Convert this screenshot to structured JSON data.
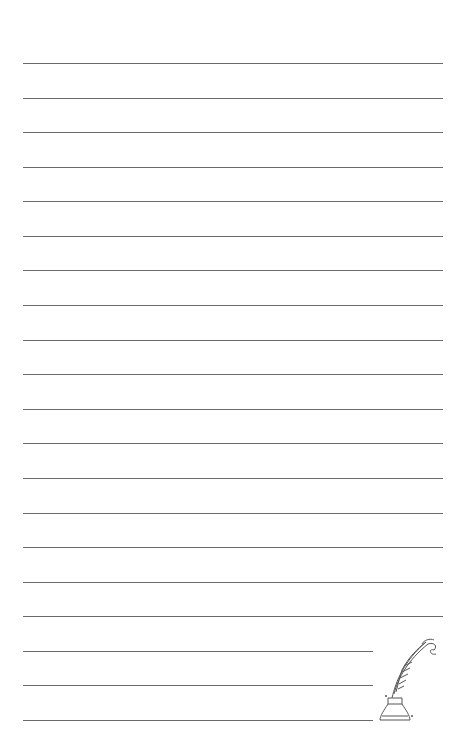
{
  "page": {
    "type": "lined writing paper",
    "line_count": 20,
    "line_color": "#6a6a6a",
    "background": "#ffffff",
    "full_lines": 17,
    "short_lines": 3
  },
  "illustration": {
    "name": "quill pen in inkwell",
    "stroke_color": "#555555"
  }
}
